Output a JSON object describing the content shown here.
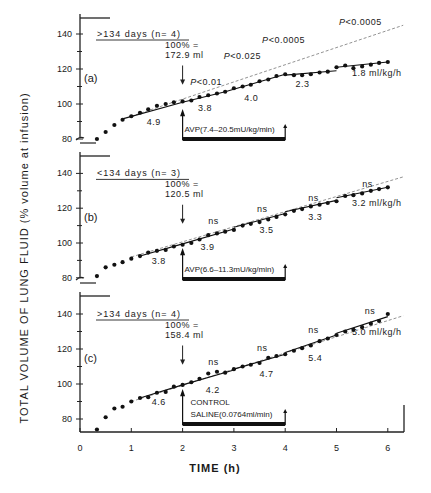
{
  "chart_data": {
    "type": "line",
    "xlabel": "TIME (h)",
    "ylabel": "TOTAL VOLUME OF LUNG FLUID (% volume at infusion)",
    "x_ticks": [
      0,
      1,
      2,
      3,
      4,
      5,
      6
    ],
    "y_ticks": [
      80,
      100,
      120,
      140
    ],
    "xlim": [
      0,
      6.3
    ],
    "ylim": [
      72,
      150
    ],
    "panels": [
      {
        "label": "(a)",
        "header": ">134 days (n= 4)",
        "baseline_note": "100% =\n172.9 ml",
        "baseline_line1": "100% =",
        "baseline_line2": "172.9 ml",
        "treatment_box": "AVP(7.4–20.5mU/kg/min)",
        "treatment_start": 2,
        "treatment_end": 4,
        "extrapolation_line": {
          "x": [
            1.0,
            6.3
          ],
          "y": [
            93,
            145
          ]
        },
        "p_values": [
          {
            "text": "P<0.01",
            "x": 2.15,
            "y": 111
          },
          {
            "text": "P<0.025",
            "x": 2.8,
            "y": 126
          },
          {
            "text": "P<0.0005",
            "x": 3.55,
            "y": 135
          },
          {
            "text": "P<0.0005",
            "x": 5.05,
            "y": 145
          }
        ],
        "slope_labels": [
          {
            "text": "4.9",
            "x": 1.3,
            "y": 88
          },
          {
            "text": "3.8",
            "x": 2.3,
            "y": 96
          },
          {
            "text": "4.0",
            "x": 3.2,
            "y": 102
          },
          {
            "text": "2.3",
            "x": 4.2,
            "y": 110
          },
          {
            "text": "1.8 ml/kg/h",
            "x": 5.3,
            "y": 116
          }
        ],
        "points": {
          "x": [
            0.33,
            0.5,
            0.67,
            0.83,
            1.0,
            1.17,
            1.33,
            1.5,
            1.67,
            1.83,
            2.0,
            2.17,
            2.33,
            2.5,
            2.67,
            2.83,
            3.0,
            3.17,
            3.33,
            3.5,
            3.67,
            3.83,
            4.0,
            4.17,
            4.33,
            4.5,
            4.67,
            4.83,
            5.0,
            5.17,
            5.33,
            5.5,
            5.67,
            5.83,
            6.0
          ],
          "y": [
            80,
            84,
            88,
            91,
            93,
            95,
            97,
            99,
            100,
            101,
            101.5,
            102,
            104,
            105,
            106,
            107,
            109,
            110,
            111,
            113,
            114,
            116,
            117,
            116.5,
            116.5,
            117,
            118,
            118.5,
            121,
            122,
            120.5,
            121.5,
            122.5,
            123.5,
            124
          ]
        },
        "fit_segments": [
          {
            "x": [
              0.83,
              2.0
            ],
            "y": [
              91.5,
              101
            ]
          },
          {
            "x": [
              2.0,
              2.83
            ],
            "y": [
              101,
              107
            ]
          },
          {
            "x": [
              2.83,
              4.0
            ],
            "y": [
              107,
              117
            ]
          },
          {
            "x": [
              4.0,
              5.0
            ],
            "y": [
              116.5,
              119
            ]
          },
          {
            "x": [
              5.0,
              6.0
            ],
            "y": [
              121,
              124
            ]
          }
        ]
      },
      {
        "label": "(b)",
        "header": "<134 days (n= 3)",
        "baseline_line1": "100% =",
        "baseline_line2": "120.5 ml",
        "treatment_box": "AVP(6.6–11.3mU/kg/min)",
        "treatment_start": 2,
        "treatment_end": 4,
        "extrapolation_line": {
          "x": [
            1.0,
            6.3
          ],
          "y": [
            92,
            138
          ]
        },
        "p_values": [
          {
            "text": "ns",
            "x": 2.5,
            "y": 111
          },
          {
            "text": "ns",
            "x": 3.45,
            "y": 118
          },
          {
            "text": "ns",
            "x": 4.45,
            "y": 124
          },
          {
            "text": "ns",
            "x": 5.5,
            "y": 132
          }
        ],
        "slope_labels": [
          {
            "text": "3.8",
            "x": 1.4,
            "y": 88
          },
          {
            "text": "3.9",
            "x": 2.35,
            "y": 96
          },
          {
            "text": "3.5",
            "x": 3.5,
            "y": 106
          },
          {
            "text": "3.3",
            "x": 4.45,
            "y": 113
          },
          {
            "text": "3.2 ml/kg/h",
            "x": 5.3,
            "y": 121
          }
        ],
        "points": {
          "x": [
            0.33,
            0.5,
            0.67,
            0.83,
            1.0,
            1.17,
            1.33,
            1.5,
            1.67,
            1.83,
            2.0,
            2.17,
            2.33,
            2.5,
            2.67,
            2.83,
            3.0,
            3.17,
            3.33,
            3.5,
            3.67,
            3.83,
            4.0,
            4.17,
            4.33,
            4.5,
            4.67,
            4.83,
            5.0,
            5.17,
            5.33,
            5.5,
            5.67,
            5.83,
            6.0
          ],
          "y": [
            81,
            86,
            87.5,
            89,
            91,
            92.5,
            94.5,
            95.5,
            96,
            98,
            99,
            100,
            102,
            104.5,
            105.5,
            106.5,
            107.5,
            110,
            111,
            112,
            113.5,
            115,
            116.5,
            118.5,
            119.5,
            121,
            122,
            123,
            124,
            127,
            127.5,
            128.5,
            130,
            131,
            132
          ]
        },
        "fit_segments": [
          {
            "x": [
              1.17,
              2.0
            ],
            "y": [
              92.5,
              99.5
            ]
          },
          {
            "x": [
              2.0,
              3.0
            ],
            "y": [
              99.5,
              108
            ]
          },
          {
            "x": [
              3.0,
              4.0
            ],
            "y": [
              109,
              117
            ]
          },
          {
            "x": [
              4.0,
              5.0
            ],
            "y": [
              118,
              124.5
            ]
          },
          {
            "x": [
              5.0,
              6.0
            ],
            "y": [
              126,
              132
            ]
          }
        ]
      },
      {
        "label": "(c)",
        "header": ">134 days (n= 4)",
        "baseline_line1": "100% =",
        "baseline_line2": "158.4 ml",
        "treatment_box_line1": "CONTROL",
        "treatment_box_line2": "SALINE(0.0764ml/min)",
        "treatment_start": 2,
        "treatment_end": 4,
        "extrapolation_line": {
          "x": [
            1.0,
            6.3
          ],
          "y": [
            90,
            139
          ]
        },
        "p_values": [
          {
            "text": "ns",
            "x": 2.5,
            "y": 111
          },
          {
            "text": "ns",
            "x": 3.45,
            "y": 119
          },
          {
            "text": "ns",
            "x": 4.45,
            "y": 129
          },
          {
            "text": "ns",
            "x": 5.55,
            "y": 140
          }
        ],
        "slope_labels": [
          {
            "text": "4.6",
            "x": 1.4,
            "y": 88
          },
          {
            "text": "4.2",
            "x": 2.45,
            "y": 95
          },
          {
            "text": "4.7",
            "x": 3.5,
            "y": 104
          },
          {
            "text": "5.4",
            "x": 4.45,
            "y": 113
          },
          {
            "text": "5.0 ml/kg/h",
            "x": 5.3,
            "y": 128
          }
        ],
        "points": {
          "x": [
            0.33,
            0.5,
            0.67,
            0.83,
            1.0,
            1.17,
            1.33,
            1.5,
            1.67,
            1.83,
            2.0,
            2.17,
            2.33,
            2.5,
            2.67,
            2.83,
            3.0,
            3.17,
            3.33,
            3.5,
            3.67,
            3.83,
            4.0,
            4.17,
            4.33,
            4.5,
            4.67,
            4.83,
            5.0,
            5.17,
            5.33,
            5.5,
            5.67,
            5.83,
            6.0
          ],
          "y": [
            74,
            81,
            86,
            87,
            90,
            92,
            92.5,
            95,
            95.5,
            98.5,
            99.5,
            101,
            103,
            106,
            107,
            106.5,
            108.5,
            110,
            111,
            112,
            115,
            116,
            117,
            119,
            120.5,
            122,
            124.5,
            126,
            128,
            130,
            131,
            132.5,
            134.5,
            136,
            140
          ]
        },
        "fit_segments": [
          {
            "x": [
              1.17,
              2.0
            ],
            "y": [
              92,
              99.5
            ]
          },
          {
            "x": [
              2.0,
              3.0
            ],
            "y": [
              99.5,
              108
            ]
          },
          {
            "x": [
              3.0,
              4.0
            ],
            "y": [
              108.5,
              117
            ]
          },
          {
            "x": [
              4.0,
              5.0
            ],
            "y": [
              118,
              128
            ]
          },
          {
            "x": [
              5.0,
              6.0
            ],
            "y": [
              129,
              138.5
            ]
          }
        ]
      }
    ]
  },
  "axes": {
    "x_title": "TIME (h)",
    "y_title": "TOTAL VOLUME OF LUNG FLUID (% volume at infusion)",
    "x_tick_labels": [
      "0",
      "1",
      "2",
      "3",
      "4",
      "5",
      "6"
    ],
    "y_tick_labels": [
      "80",
      "100",
      "120",
      "140"
    ]
  }
}
